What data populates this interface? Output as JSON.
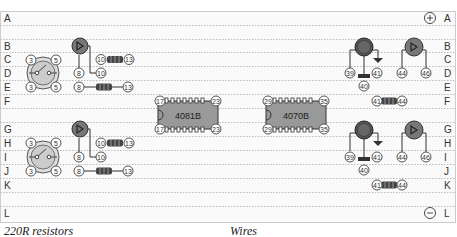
{
  "board": {
    "rows_left": [
      "A",
      "B",
      "C",
      "D",
      "E",
      "F",
      "G",
      "H",
      "I",
      "J",
      "K",
      "L"
    ],
    "rows_right": [
      "A",
      "B",
      "C",
      "D",
      "E",
      "F",
      "G",
      "H",
      "I",
      "J",
      "K",
      "L"
    ],
    "rail_top_symbol": "+",
    "rail_bottom_symbol": "−"
  },
  "components": {
    "switch_top": {
      "pins": [
        "3",
        "5",
        "3",
        "5"
      ]
    },
    "switch_bottom": {
      "pins": [
        "3",
        "5",
        "3",
        "5"
      ]
    },
    "led_left_top": {
      "pins": [
        "8",
        "10"
      ]
    },
    "led_left_bottom": {
      "pins": [
        "8",
        "10"
      ]
    },
    "resistor_left_top_a": {
      "pins": [
        "10",
        "13"
      ]
    },
    "resistor_left_top_b": {
      "pins": [
        "8",
        "13"
      ]
    },
    "resistor_left_bottom_a": {
      "pins": [
        "10",
        "13"
      ]
    },
    "resistor_left_bottom_b": {
      "pins": [
        "8",
        "13"
      ]
    },
    "ic1": {
      "label": "4081B",
      "pins": [
        "17",
        "23",
        "17",
        "23"
      ]
    },
    "ic2": {
      "label": "4070B",
      "pins": [
        "29",
        "35",
        "29",
        "35"
      ]
    },
    "transistor_top": {
      "pins": [
        "39",
        "41",
        "40"
      ]
    },
    "transistor_bottom": {
      "pins": [
        "39",
        "41",
        "40"
      ]
    },
    "led_right_top": {
      "pins": [
        "44",
        "46"
      ]
    },
    "led_right_bottom": {
      "pins": [
        "44",
        "46"
      ]
    },
    "resistor_right_top": {
      "pins": [
        "41",
        "44"
      ]
    },
    "resistor_right_bottom": {
      "pins": [
        "41",
        "44"
      ]
    }
  },
  "captions": {
    "left": "220R resistors",
    "right": "Wires"
  }
}
